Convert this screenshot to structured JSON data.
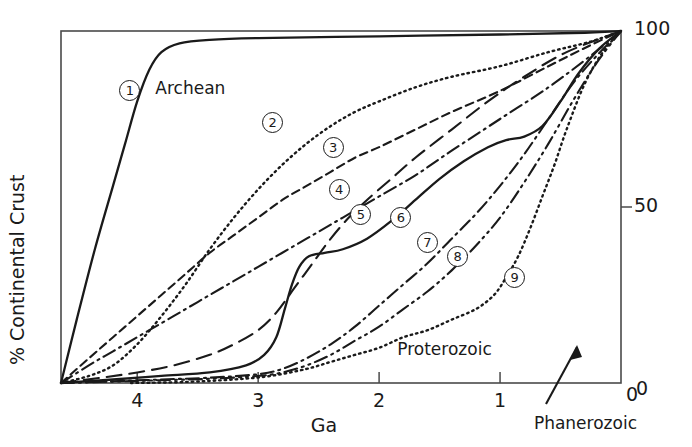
{
  "chart_data": {
    "type": "line",
    "title": "",
    "xlabel": "Ga",
    "ylabel": "% Continental Crust",
    "xlim": [
      4.63,
      0
    ],
    "ylim": [
      0,
      100
    ],
    "x_ticks": [
      "4",
      "3",
      "2",
      "1",
      "0"
    ],
    "x_tick_values": [
      4,
      3,
      2,
      1,
      0
    ],
    "y_ticks": [
      "100",
      "50",
      "0"
    ],
    "y_tick_values": [
      100,
      50,
      0
    ],
    "x_axis_reversed": true,
    "grid": false,
    "legend": "inline-numbered-markers",
    "annotations": [
      {
        "text": "Archean",
        "x": 3.85,
        "y": 86
      },
      {
        "text": "Proterozoic",
        "x": 1.85,
        "y": 12
      },
      {
        "text": "Phanerozoic",
        "x": 0.72,
        "y": -9,
        "arrow": "points up-right into plot"
      }
    ],
    "series": [
      {
        "name": "1",
        "style": "solid",
        "label_x": 4.06,
        "label_y": 83,
        "points": [
          [
            4.63,
            0
          ],
          [
            4.5,
            18
          ],
          [
            4.35,
            38
          ],
          [
            4.2,
            56
          ],
          [
            4.1,
            68
          ],
          [
            4.0,
            80
          ],
          [
            3.9,
            89
          ],
          [
            3.8,
            94
          ],
          [
            3.65,
            96.5
          ],
          [
            3.4,
            97.5
          ],
          [
            3.0,
            98
          ],
          [
            2.0,
            98.5
          ],
          [
            1.0,
            99
          ],
          [
            0.3,
            99.5
          ],
          [
            0,
            100
          ]
        ]
      },
      {
        "name": "2",
        "style": "dotted",
        "label_x": 2.88,
        "label_y": 74,
        "points": [
          [
            4.63,
            0
          ],
          [
            4.4,
            2
          ],
          [
            4.2,
            5
          ],
          [
            4.0,
            11
          ],
          [
            3.8,
            19
          ],
          [
            3.6,
            28
          ],
          [
            3.4,
            38
          ],
          [
            3.2,
            47
          ],
          [
            3.0,
            55
          ],
          [
            2.8,
            62
          ],
          [
            2.6,
            68
          ],
          [
            2.4,
            73
          ],
          [
            2.2,
            77
          ],
          [
            2.0,
            80
          ],
          [
            1.7,
            84
          ],
          [
            1.4,
            87
          ],
          [
            1.0,
            90
          ],
          [
            0.6,
            94
          ],
          [
            0.25,
            97
          ],
          [
            0,
            100
          ]
        ]
      },
      {
        "name": "3",
        "style": "dashed",
        "label_x": 2.38,
        "label_y": 67,
        "points": [
          [
            4.63,
            0
          ],
          [
            4.4,
            7
          ],
          [
            4.2,
            13
          ],
          [
            4.0,
            19
          ],
          [
            3.8,
            25
          ],
          [
            3.6,
            31
          ],
          [
            3.4,
            37
          ],
          [
            3.2,
            42
          ],
          [
            3.0,
            47
          ],
          [
            2.8,
            52
          ],
          [
            2.6,
            56
          ],
          [
            2.4,
            60
          ],
          [
            2.2,
            64
          ],
          [
            2.0,
            67
          ],
          [
            1.7,
            72
          ],
          [
            1.4,
            77
          ],
          [
            1.0,
            83
          ],
          [
            0.6,
            90
          ],
          [
            0.25,
            96
          ],
          [
            0,
            100
          ]
        ]
      },
      {
        "name": "4",
        "style": "dash-dot",
        "label_x": 2.33,
        "label_y": 55,
        "points": [
          [
            4.63,
            0
          ],
          [
            4.4,
            5
          ],
          [
            4.2,
            9
          ],
          [
            4.0,
            13
          ],
          [
            3.8,
            17
          ],
          [
            3.6,
            21
          ],
          [
            3.4,
            25
          ],
          [
            3.2,
            29
          ],
          [
            3.0,
            33
          ],
          [
            2.8,
            37
          ],
          [
            2.6,
            41
          ],
          [
            2.4,
            45
          ],
          [
            2.2,
            49
          ],
          [
            2.0,
            53
          ],
          [
            1.7,
            59
          ],
          [
            1.4,
            66
          ],
          [
            1.0,
            75
          ],
          [
            0.6,
            84
          ],
          [
            0.25,
            93
          ],
          [
            0,
            100
          ]
        ]
      },
      {
        "name": "5",
        "style": "long-dash",
        "label_x": 2.15,
        "label_y": 48,
        "points": [
          [
            4.63,
            0
          ],
          [
            4.3,
            1.5
          ],
          [
            4.0,
            3
          ],
          [
            3.7,
            5
          ],
          [
            3.4,
            8
          ],
          [
            3.2,
            11
          ],
          [
            3.0,
            15
          ],
          [
            2.85,
            20
          ],
          [
            2.7,
            27
          ],
          [
            2.55,
            34
          ],
          [
            2.4,
            41
          ],
          [
            2.25,
            47
          ],
          [
            2.1,
            52
          ],
          [
            1.9,
            58
          ],
          [
            1.7,
            64
          ],
          [
            1.4,
            72
          ],
          [
            1.1,
            80
          ],
          [
            0.8,
            87
          ],
          [
            0.45,
            94
          ],
          [
            0,
            100
          ]
        ]
      },
      {
        "name": "6",
        "style": "solid",
        "label_x": 1.82,
        "label_y": 47,
        "points": [
          [
            4.63,
            0
          ],
          [
            4.2,
            1
          ],
          [
            3.8,
            2
          ],
          [
            3.4,
            3
          ],
          [
            3.1,
            5
          ],
          [
            2.95,
            8
          ],
          [
            2.85,
            13
          ],
          [
            2.78,
            21
          ],
          [
            2.72,
            28
          ],
          [
            2.66,
            33
          ],
          [
            2.58,
            36
          ],
          [
            2.45,
            37
          ],
          [
            2.3,
            38
          ],
          [
            2.1,
            41
          ],
          [
            1.9,
            46
          ],
          [
            1.7,
            52
          ],
          [
            1.5,
            58
          ],
          [
            1.3,
            63
          ],
          [
            1.1,
            67
          ],
          [
            0.95,
            69
          ],
          [
            0.8,
            70
          ],
          [
            0.65,
            73
          ],
          [
            0.5,
            80
          ],
          [
            0.35,
            88
          ],
          [
            0.18,
            95
          ],
          [
            0,
            100
          ]
        ]
      },
      {
        "name": "7",
        "style": "dash-dot",
        "label_x": 1.6,
        "label_y": 40,
        "points": [
          [
            4.63,
            0
          ],
          [
            4.2,
            0.5
          ],
          [
            3.8,
            1
          ],
          [
            3.4,
            1.5
          ],
          [
            3.0,
            2.5
          ],
          [
            2.8,
            4
          ],
          [
            2.6,
            7
          ],
          [
            2.4,
            11
          ],
          [
            2.2,
            16
          ],
          [
            2.0,
            22
          ],
          [
            1.8,
            28
          ],
          [
            1.6,
            34
          ],
          [
            1.4,
            41
          ],
          [
            1.2,
            48
          ],
          [
            1.0,
            56
          ],
          [
            0.8,
            65
          ],
          [
            0.6,
            75
          ],
          [
            0.4,
            85
          ],
          [
            0.2,
            93
          ],
          [
            0,
            100
          ]
        ]
      },
      {
        "name": "8",
        "style": "dash-dot-dot",
        "label_x": 1.35,
        "label_y": 36,
        "points": [
          [
            4.63,
            0
          ],
          [
            4.2,
            0.4
          ],
          [
            3.8,
            0.8
          ],
          [
            3.4,
            1.2
          ],
          [
            3.0,
            2
          ],
          [
            2.8,
            3
          ],
          [
            2.6,
            5
          ],
          [
            2.4,
            8
          ],
          [
            2.2,
            12
          ],
          [
            2.0,
            16
          ],
          [
            1.8,
            21
          ],
          [
            1.6,
            26
          ],
          [
            1.4,
            32
          ],
          [
            1.2,
            39
          ],
          [
            1.0,
            47
          ],
          [
            0.8,
            57
          ],
          [
            0.6,
            68
          ],
          [
            0.4,
            80
          ],
          [
            0.2,
            91
          ],
          [
            0,
            100
          ]
        ]
      },
      {
        "name": "9",
        "style": "dotted",
        "label_x": 0.88,
        "label_y": 30,
        "points": [
          [
            4.05,
            0
          ],
          [
            3.6,
            0.3
          ],
          [
            3.2,
            1
          ],
          [
            2.9,
            2
          ],
          [
            2.6,
            4
          ],
          [
            2.4,
            6
          ],
          [
            2.2,
            8
          ],
          [
            2.0,
            10
          ],
          [
            1.8,
            13
          ],
          [
            1.6,
            15
          ],
          [
            1.4,
            18
          ],
          [
            1.2,
            21
          ],
          [
            1.05,
            25
          ],
          [
            0.95,
            30
          ],
          [
            0.85,
            36
          ],
          [
            0.75,
            44
          ],
          [
            0.65,
            53
          ],
          [
            0.55,
            62
          ],
          [
            0.45,
            72
          ],
          [
            0.3,
            85
          ],
          [
            0.15,
            94
          ],
          [
            0,
            100
          ]
        ]
      }
    ]
  }
}
